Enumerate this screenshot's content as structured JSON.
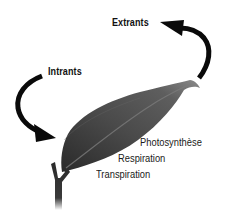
{
  "diagram": {
    "labels": {
      "extrants": "Extrants",
      "intrants": "Intrants"
    },
    "processes": [
      {
        "label": "Photosynthèse"
      },
      {
        "label": "Respiration"
      },
      {
        "label": "Transpiration"
      }
    ],
    "elements": {
      "leaf": "leaf",
      "stem": "stem",
      "arrow_in": "arrow-intrants",
      "arrow_out": "arrow-extrants"
    },
    "colors": {
      "background": "#ffffff",
      "arrow": "#0a0a0a",
      "leaf_dark": "#2b2b2b",
      "leaf_mid": "#5a5a5a",
      "text": "#111111"
    }
  }
}
